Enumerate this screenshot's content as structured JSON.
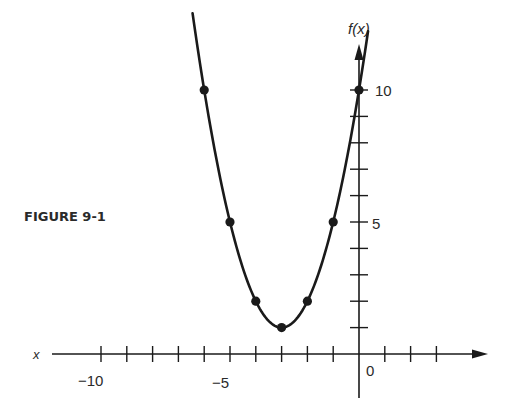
{
  "caption": "FIGURE 9-1",
  "chart_data": {
    "type": "line",
    "title": "",
    "xlabel": "x",
    "ylabel": "f(x)",
    "function": "f(x) = (x+3)^2 + 1",
    "x": [
      -6,
      -5,
      -4,
      -3,
      -2,
      -1,
      0
    ],
    "values": [
      10,
      5,
      2,
      1,
      2,
      5,
      10
    ],
    "series": [
      {
        "name": "f(x)",
        "x": [
          -6,
          -5,
          -4,
          -3,
          -2,
          -1,
          0
        ],
        "values": [
          10,
          5,
          2,
          1,
          2,
          5,
          10
        ],
        "markers": true
      }
    ],
    "xlim": [
      -12,
      5
    ],
    "ylim": [
      0,
      11
    ],
    "x_ticks": [
      -10,
      -9,
      -8,
      -7,
      -6,
      -5,
      -4,
      -3,
      -2,
      -1,
      0,
      1,
      2,
      3
    ],
    "x_tick_labels": [
      "-10",
      "-5",
      "0"
    ],
    "y_ticks": [
      1,
      2,
      3,
      4,
      5,
      6,
      7,
      8,
      9,
      10
    ],
    "y_tick_labels": [
      "5",
      "10"
    ],
    "grid": false,
    "legend": null
  },
  "labels": {
    "x_axis": "x",
    "y_axis": "f(x)",
    "tick_neg10": "−10",
    "tick_neg5": "−5",
    "tick_0": "0",
    "tick_5": "5",
    "tick_10": "10"
  },
  "colors": {
    "ink": "#1a1a1a",
    "background": "#ffffff"
  }
}
